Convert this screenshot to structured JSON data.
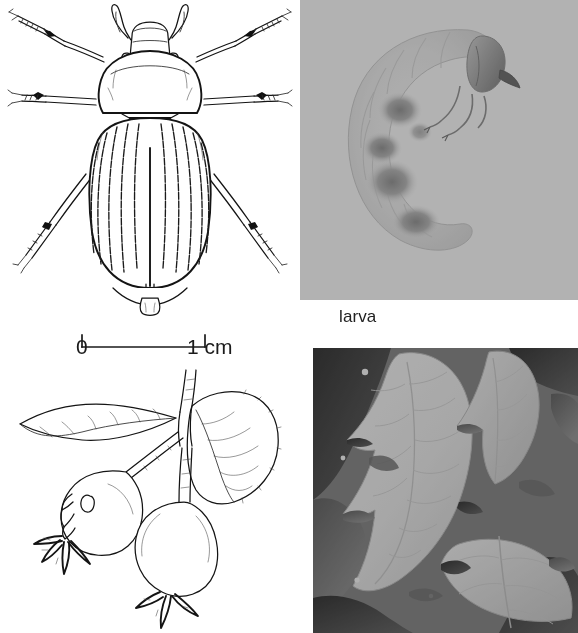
{
  "figure": {
    "kind": "scientific-plate",
    "background_color": "#ffffff",
    "ink_color": "#141414",
    "panel_count": 4
  },
  "beetle": {
    "name": "adult-beetle-dorsal-line-drawing",
    "description": "Dorsal view line drawing of a scarab-type chafer beetle with striated elytra, clubbed lamellate antennae and spined legs",
    "features": {
      "antennae": "lamellate-clubbed",
      "scutellum": "black-triangular",
      "elytra_striae_count": 10,
      "leg_pairs": 3,
      "pygidium": "pointed"
    }
  },
  "scale_bar": {
    "name": "scale-bar",
    "start_label": "0",
    "end_label": "1 cm",
    "length_value": 1,
    "unit": "cm",
    "tick_positions": [
      "0",
      "1"
    ]
  },
  "larva": {
    "name": "larva-photograph",
    "caption": "larva",
    "description": "Halftone photograph of a pale C-shaped white grub with dark gut contents visible through the cuticle and three pairs of thoracic legs",
    "tone": "very-light-halftone"
  },
  "plant": {
    "name": "fruit-branch-line-drawing",
    "description": "Line drawing of a twig bearing two serrated leaves and two rose-hip fruits; the left fruit shows feeding holes chewed into its surface",
    "elements": {
      "leaves": 2,
      "fruits": 2,
      "damaged_fruit": "left",
      "damage_type": "feeding-holes"
    }
  },
  "damage_photo": {
    "name": "leaf-damage-photograph",
    "description": "Grayscale halftone close-up photograph of foliage with leaf blades heavily notched and skeletonised along the margins by beetle feeding",
    "tone": "high-contrast-halftone"
  },
  "colors": {
    "paper": "#ffffff",
    "ink": "#141414",
    "text": "#1b1b1b",
    "photo_dark": "#4a4a4a",
    "photo_light": "#f4f4f4"
  }
}
